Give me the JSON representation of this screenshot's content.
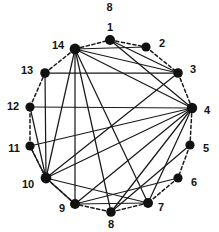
{
  "figure": {
    "caption_top": "8",
    "kind": "circular-graph-diagram",
    "background_color": "#ffffff",
    "node_color": "#111111",
    "solid_edge_color": "#1a1a1a",
    "dashed_edge_color": "#1a1a1a",
    "label_color": "#131313"
  },
  "chart_data": {
    "type": "scatter",
    "title": "8",
    "xlabel": "",
    "ylabel": "",
    "layout": "circular",
    "grid": false,
    "legend": "none",
    "xlim": [
      0,
      219
    ],
    "ylim": [
      0,
      232
    ],
    "nodes": [
      {
        "id": "1",
        "x": 110,
        "y": 40,
        "label": "1",
        "label_x": 110,
        "label_y": 27,
        "radius": 5.0
      },
      {
        "id": "2",
        "x": 146,
        "y": 47,
        "label": "2",
        "label_x": 162,
        "label_y": 43,
        "radius": 4.6
      },
      {
        "id": "3",
        "x": 178,
        "y": 73,
        "label": "3",
        "label_x": 193,
        "label_y": 69,
        "radius": 4.8
      },
      {
        "id": "4",
        "x": 192,
        "y": 108,
        "label": "4",
        "label_x": 207,
        "label_y": 110,
        "radius": 5.2
      },
      {
        "id": "5",
        "x": 190,
        "y": 145,
        "label": "5",
        "label_x": 206,
        "label_y": 148,
        "radius": 4.6
      },
      {
        "id": "6",
        "x": 178,
        "y": 178,
        "label": "6",
        "label_x": 194,
        "label_y": 182,
        "radius": 4.6
      },
      {
        "id": "7",
        "x": 148,
        "y": 203,
        "label": "7",
        "label_x": 161,
        "label_y": 207,
        "radius": 5.0
      },
      {
        "id": "8",
        "x": 111,
        "y": 212,
        "label": "8",
        "label_x": 111,
        "label_y": 224,
        "radius": 4.8
      },
      {
        "id": "9",
        "x": 75,
        "y": 204,
        "label": "9",
        "label_x": 62,
        "label_y": 208,
        "radius": 5.0
      },
      {
        "id": "10",
        "x": 46,
        "y": 178,
        "label": "10",
        "label_x": 28,
        "label_y": 184,
        "radius": 5.4
      },
      {
        "id": "11",
        "x": 30,
        "y": 146,
        "label": "11",
        "label_x": 14,
        "label_y": 148,
        "radius": 4.6
      },
      {
        "id": "12",
        "x": 30,
        "y": 107,
        "label": "12",
        "label_x": 13,
        "label_y": 106,
        "radius": 4.6
      },
      {
        "id": "13",
        "x": 45,
        "y": 73,
        "label": "13",
        "label_x": 27,
        "label_y": 70,
        "radius": 4.8
      },
      {
        "id": "14",
        "x": 75,
        "y": 49,
        "label": "14",
        "label_x": 58,
        "label_y": 45,
        "radius": 5.4
      }
    ],
    "dashed_edges": [
      [
        "1",
        "2"
      ],
      [
        "2",
        "3"
      ],
      [
        "3",
        "4"
      ],
      [
        "4",
        "5"
      ],
      [
        "5",
        "6"
      ],
      [
        "6",
        "7"
      ],
      [
        "7",
        "8"
      ],
      [
        "8",
        "9"
      ],
      [
        "9",
        "10"
      ],
      [
        "10",
        "11"
      ],
      [
        "11",
        "12"
      ],
      [
        "12",
        "13"
      ],
      [
        "13",
        "14"
      ],
      [
        "14",
        "1"
      ]
    ],
    "solid_edges": [
      [
        "1",
        "3"
      ],
      [
        "1",
        "4"
      ],
      [
        "14",
        "2"
      ],
      [
        "14",
        "3"
      ],
      [
        "14",
        "4"
      ],
      [
        "14",
        "7"
      ],
      [
        "14",
        "8"
      ],
      [
        "14",
        "9"
      ],
      [
        "14",
        "10"
      ],
      [
        "13",
        "3"
      ],
      [
        "13",
        "10"
      ],
      [
        "12",
        "10"
      ],
      [
        "11",
        "10"
      ],
      [
        "10",
        "3"
      ],
      [
        "10",
        "4"
      ],
      [
        "10",
        "7"
      ],
      [
        "10",
        "9"
      ],
      [
        "4",
        "7"
      ],
      [
        "4",
        "8"
      ],
      [
        "4",
        "9"
      ],
      [
        "4",
        "11"
      ],
      [
        "4",
        "12"
      ],
      [
        "9",
        "7"
      ],
      [
        "9",
        "6"
      ],
      [
        "8",
        "5"
      ]
    ]
  }
}
